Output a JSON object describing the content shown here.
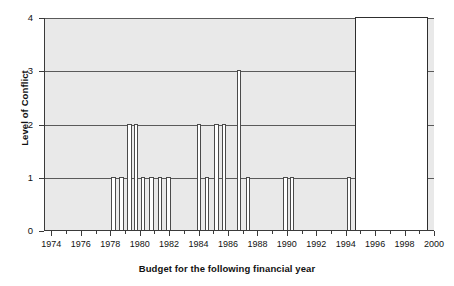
{
  "chart_data": {
    "type": "bar",
    "title": "",
    "xlabel": "Budget for the following financial year",
    "ylabel": "Level of Conflict",
    "xlim": [
      1973.5,
      2000.0
    ],
    "ylim": [
      0,
      4
    ],
    "grid": true,
    "legend": null,
    "yticks": [
      "0",
      "1",
      "2",
      "3",
      "4"
    ],
    "ytick_values": [
      0,
      1,
      2,
      3,
      4
    ],
    "xticks": [
      "1974",
      "1976",
      "1978",
      "1980",
      "1982",
      "1984",
      "1986",
      "1988",
      "1990",
      "1992",
      "1994",
      "1996",
      "1998",
      "2000"
    ],
    "xtick_values": [
      1974,
      1976,
      1978,
      1980,
      1982,
      1984,
      1986,
      1988,
      1990,
      1992,
      1994,
      1996,
      1998,
      2000
    ],
    "xtick_minor_values": [
      1975,
      1977,
      1979,
      1981,
      1983,
      1985,
      1987,
      1989,
      1991,
      1993,
      1995,
      1997,
      1999
    ],
    "bar_style": "white fill with dark outline on grey panel",
    "bars": [
      {
        "x": 1978.0,
        "width": 0.3,
        "value": 1,
        "fill": "white"
      },
      {
        "x": 1978.55,
        "width": 0.3,
        "value": 1,
        "fill": "white"
      },
      {
        "x": 1979.1,
        "width": 0.3,
        "value": 2,
        "fill": "white"
      },
      {
        "x": 1979.55,
        "width": 0.3,
        "value": 2,
        "fill": "white"
      },
      {
        "x": 1980.0,
        "width": 0.3,
        "value": 1,
        "fill": "white"
      },
      {
        "x": 1980.6,
        "width": 0.3,
        "value": 1,
        "fill": "white"
      },
      {
        "x": 1981.15,
        "width": 0.3,
        "value": 1,
        "fill": "white"
      },
      {
        "x": 1981.75,
        "width": 0.3,
        "value": 1,
        "fill": "white"
      },
      {
        "x": 1983.8,
        "width": 0.3,
        "value": 2,
        "fill": "white"
      },
      {
        "x": 1984.35,
        "width": 0.3,
        "value": 1,
        "fill": "white"
      },
      {
        "x": 1985.0,
        "width": 0.3,
        "value": 2,
        "fill": "white"
      },
      {
        "x": 1985.5,
        "width": 0.3,
        "value": 2,
        "fill": "white"
      },
      {
        "x": 1986.55,
        "width": 0.3,
        "value": 3,
        "fill": "white"
      },
      {
        "x": 1987.15,
        "width": 0.3,
        "value": 1,
        "fill": "white"
      },
      {
        "x": 1989.7,
        "width": 0.3,
        "value": 1,
        "fill": "white"
      },
      {
        "x": 1990.15,
        "width": 0.3,
        "value": 1,
        "fill": "white"
      },
      {
        "x": 1994.0,
        "width": 0.28,
        "value": 1,
        "fill": "white"
      },
      {
        "x": 1994.85,
        "width": 0.4,
        "value": 1,
        "fill": "black"
      },
      {
        "x": 1995.65,
        "width": 0.4,
        "value": 1,
        "fill": "black"
      },
      {
        "x": 1994.55,
        "width": 5.0,
        "value": 4,
        "fill": "white"
      }
    ]
  },
  "figure": {
    "background_color": "#ffffff",
    "panel_color": "#e9e9e9",
    "axis_color": "#3a3a3a",
    "bar_outline_color": "#4a4a4a",
    "bar_fill_color": "#ffffff",
    "highlight_color": "#000000"
  }
}
